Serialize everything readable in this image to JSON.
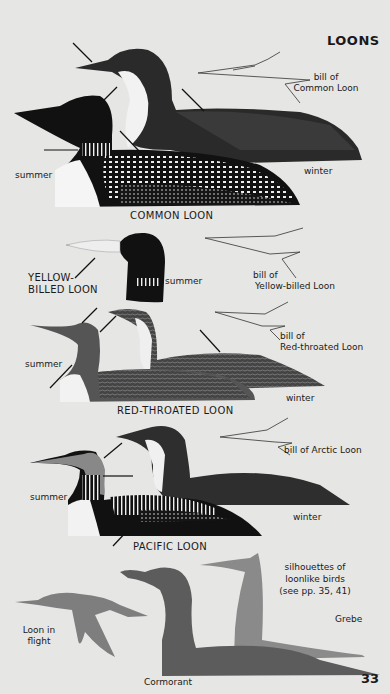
{
  "page": {
    "title": "LOONS",
    "page_number": "33"
  },
  "sections": {
    "common": {
      "caption": "COMMON LOON",
      "summer": "summer",
      "winter": "winter",
      "bill_label_1": "bill of",
      "bill_label_2": "Common Loon"
    },
    "yellow_billed": {
      "caption_1": "YELLOW-",
      "caption_2": "BILLED LOON",
      "summer": "summer",
      "bill_label_1": "bill of",
      "bill_label_2": "Yellow-billed Loon"
    },
    "red_throated": {
      "caption": "RED-THROATED LOON",
      "summer": "summer",
      "winter": "winter",
      "bill_label_1": "bill of",
      "bill_label_2": "Red-throated Loon"
    },
    "pacific": {
      "caption": "PACIFIC LOON",
      "summer": "summer",
      "winter": "winter",
      "bill_label": "bill of Arctic Loon"
    },
    "silhouettes": {
      "heading_1": "silhouettes of",
      "heading_2": "loonlike birds",
      "heading_3": "(see pp. 35, 41)",
      "grebe": "Grebe",
      "cormorant": "Cormorant",
      "flight_1": "Loon in",
      "flight_2": "flight"
    }
  },
  "colors": {
    "background": "#e6e6e4",
    "ink": "#1a1a1a",
    "cormorant": "#5c5c5c",
    "grebe": "#8a8a8a",
    "flight": "#7e7e7e"
  }
}
